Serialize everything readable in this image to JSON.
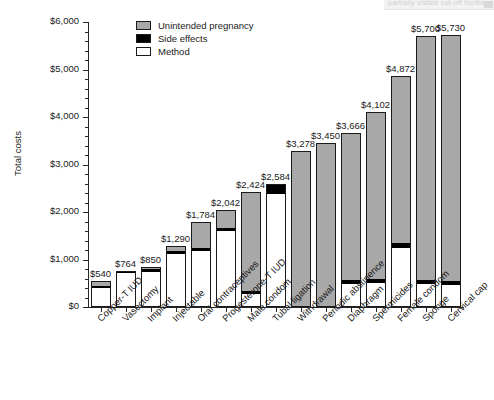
{
  "top_artifact": {
    "text": "partially visible cut-off toolbar",
    "visible": true
  },
  "chart_data": {
    "type": "bar",
    "subtype": "stacked-vertical",
    "title": "",
    "xlabel": "",
    "ylabel": "Total costs",
    "ylim": [
      0,
      6000
    ],
    "ytick_values": [
      0,
      1000,
      2000,
      3000,
      4000,
      5000,
      6000
    ],
    "ytick_labels": [
      "$0",
      "$1,000",
      "$2,000",
      "$3,000",
      "$4,000",
      "$5,000",
      "$6,000"
    ],
    "yminor_step": 200,
    "grid": false,
    "legend_position": "top-center",
    "categories": [
      "Copper-T IUD",
      "Vasectomy",
      "Implant",
      "Injectable",
      "Oral contraceptives",
      "Progesterone-T IUD",
      "Male condom",
      "Tubal ligation",
      "Withdrawal",
      "Periodic abstinence",
      "Diaphragm",
      "Spermicides",
      "Female condom",
      "Sponge",
      "Cervical cap"
    ],
    "series": [
      {
        "name": "Method",
        "color": "#ffffff",
        "values": [
          400,
          740,
          760,
          1130,
          1190,
          1620,
          250,
          2400,
          0,
          0,
          460,
          480,
          1230,
          460,
          440
        ]
      },
      {
        "name": "Side effects",
        "color": "#000000",
        "values": [
          50,
          24,
          50,
          60,
          60,
          50,
          74,
          184,
          0,
          0,
          100,
          90,
          100,
          100,
          100
        ]
      },
      {
        "name": "Unintended pregnancy",
        "color": "#a8a8a8",
        "values": [
          90,
          0,
          40,
          100,
          534,
          372,
          2100,
          0,
          3278,
          3450,
          3106,
          3532,
          3542,
          5140,
          5190
        ]
      }
    ],
    "totals": [
      540,
      764,
      850,
      1290,
      1784,
      2042,
      2424,
      2584,
      3278,
      3450,
      3666,
      4102,
      4872,
      5700,
      5730
    ],
    "total_labels": [
      "$540",
      "$764",
      "$850",
      "$1,290",
      "$1,784",
      "$2,042",
      "$2,424",
      "$2,584",
      "$3,278",
      "$3,450",
      "$3,666",
      "$4,102",
      "$4,872",
      "$5,700",
      "$5,730"
    ],
    "legend_entries": [
      {
        "label": "Unintended pregnancy",
        "color": "#a8a8a8"
      },
      {
        "label": "Side effects",
        "color": "#000000"
      },
      {
        "label": "Method",
        "color": "#ffffff"
      }
    ]
  }
}
